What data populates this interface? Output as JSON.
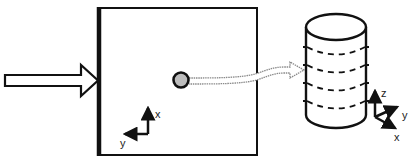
{
  "diagram": {
    "colors": {
      "stroke": "#111111",
      "background": "#ffffff",
      "particle_fill": "#bdbdbd",
      "flow_arrow_stroke": "#8a8a8a"
    },
    "input_arrow": {
      "label": ""
    },
    "plane": {
      "axes": {
        "up_label": "x",
        "left_label": "y"
      }
    },
    "particle": {
      "label": ""
    },
    "cylinder": {
      "slice_count": 4,
      "axes": {
        "up_label": "z",
        "right_label": "y",
        "down_label": "x"
      }
    }
  }
}
